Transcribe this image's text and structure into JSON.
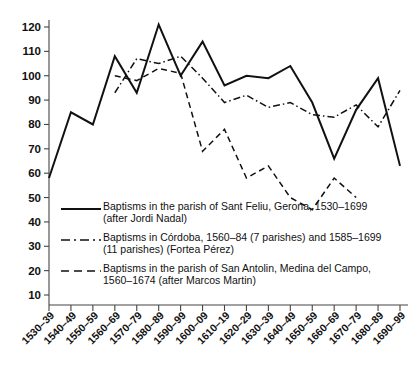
{
  "chart_data": {
    "type": "line",
    "title": "",
    "subtitle": "",
    "xlabel": "",
    "ylabel": "",
    "ylim": [
      0,
      125
    ],
    "yticks": [
      10,
      20,
      30,
      40,
      50,
      60,
      70,
      80,
      90,
      100,
      110,
      120
    ],
    "grid": false,
    "legend_position": "inside-bottom-left",
    "categories": [
      "1530–39",
      "1540–49",
      "1550–59",
      "1560–69",
      "1570–79",
      "1580–89",
      "1590–99",
      "1600–09",
      "1610–19",
      "1620–29",
      "1630–39",
      "1640–49",
      "1650–59",
      "1660–69",
      "1670–79",
      "1680–89",
      "1690–99"
    ],
    "series": [
      {
        "name": "Baptisms in the parish of Sant Feliu, Gerona, 1530–1699 (after Jordi Nadal)",
        "style": "solid",
        "x": [
          "1530–39",
          "1540–49",
          "1550–59",
          "1560–69",
          "1570–79",
          "1580–89",
          "1590–99",
          "1600–09",
          "1610–19",
          "1620–29",
          "1630–39",
          "1640–49",
          "1650–59",
          "1660–69",
          "1670–79",
          "1680–89",
          "1690–99"
        ],
        "values": [
          58,
          85,
          80,
          108,
          93,
          121,
          100,
          114,
          96,
          100,
          99,
          104,
          89,
          66,
          86,
          99,
          63
        ]
      },
      {
        "name": "Baptisms in Córdoba, 1560–84 (7 parishes) and 1585–1699 (11 parishes) (Fortea Pérez)",
        "style": "dashdot",
        "x": [
          "1560–69",
          "1570–79",
          "1580–89",
          "1590–99",
          "1600–09",
          "1610–19",
          "1620–29",
          "1630–39",
          "1640–49",
          "1650–59",
          "1660–69",
          "1670–79",
          "1680–89",
          "1690–99"
        ],
        "values": [
          93,
          107,
          105,
          108,
          99,
          89,
          92,
          87,
          89,
          84,
          83,
          88,
          79,
          94
        ]
      },
      {
        "name": "Baptisms in the parish of San Antolin, Medina del Campo, 1560–1674 (after Marcos Martin)",
        "style": "dashed",
        "x": [
          "1560–69",
          "1570–79",
          "1580–89",
          "1590–99",
          "1600–09",
          "1610–19",
          "1620–29",
          "1630–39",
          "1640–49",
          "1650–59",
          "1660–69",
          "1670–79"
        ],
        "values": [
          100,
          98,
          103,
          101,
          69,
          78,
          58,
          63,
          50,
          45,
          58,
          50
        ]
      }
    ]
  },
  "legend": {
    "entries": [
      {
        "key": "solid-line-key",
        "line1": "Baptisms in the parish of Sant Feliu, Gerona, 1530–1699",
        "line2": "(after Jordi Nadal)"
      },
      {
        "key": "dashdot-line-key",
        "line1": "Baptisms in Córdoba, 1560–84 (7 parishes) and 1585–1699",
        "line2": "(11 parishes) (Fortea Pérez)"
      },
      {
        "key": "dashed-line-key",
        "line1": "Baptisms in the parish of San Antolin, Medina del Campo,",
        "line2": "1560–1674 (after Marcos Martin)"
      }
    ]
  },
  "colors": {
    "line": "#111111",
    "axis": "#444444",
    "background": "#ffffff"
  }
}
